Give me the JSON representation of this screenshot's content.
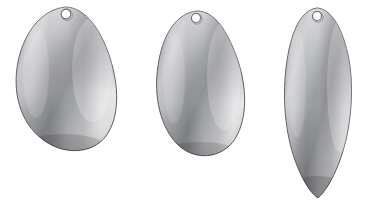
{
  "scene": {
    "title": "Spinner Blade Shapes",
    "background_color": "#ffffff",
    "width": 370,
    "height": 214,
    "object_count": 3,
    "material": "brushed nickel metal"
  },
  "palette": {
    "background": "#ffffff",
    "outline": "#5f6165",
    "metal_dark": "#7d7f83",
    "metal_mid": "#a9abaf",
    "metal_light": "#d6d8da",
    "metal_highlight": "#f2f3f4",
    "metal_shadow": "#6e7074",
    "hole_fill": "#ffffff",
    "hole_ring": "#6a6c70"
  },
  "blades": [
    {
      "id": "blade-1",
      "name": "colorado-blade",
      "style_label": "Colorado",
      "description": "wide rounded teardrop spinner blade",
      "bbox": {
        "x": 16,
        "y": 7,
        "width": 100,
        "height": 146
      },
      "hole": {
        "cx": 66,
        "cy": 14,
        "r": 5
      },
      "finish": "brushed nickel"
    },
    {
      "id": "blade-2",
      "name": "indiana-blade",
      "style_label": "Indiana",
      "description": "narrow teardrop spinner blade",
      "bbox": {
        "x": 155,
        "y": 11,
        "width": 91,
        "height": 147
      },
      "hole": {
        "cx": 196,
        "cy": 18,
        "r": 4.5
      },
      "finish": "brushed nickel"
    },
    {
      "id": "blade-3",
      "name": "willow-leaf-blade",
      "style_label": "Willow Leaf",
      "description": "elongated pointed leaf spinner blade",
      "bbox": {
        "x": 283,
        "y": 8,
        "width": 71,
        "height": 190
      },
      "hole": {
        "cx": 317,
        "cy": 16,
        "r": 4.5
      },
      "finish": "brushed nickel"
    }
  ]
}
